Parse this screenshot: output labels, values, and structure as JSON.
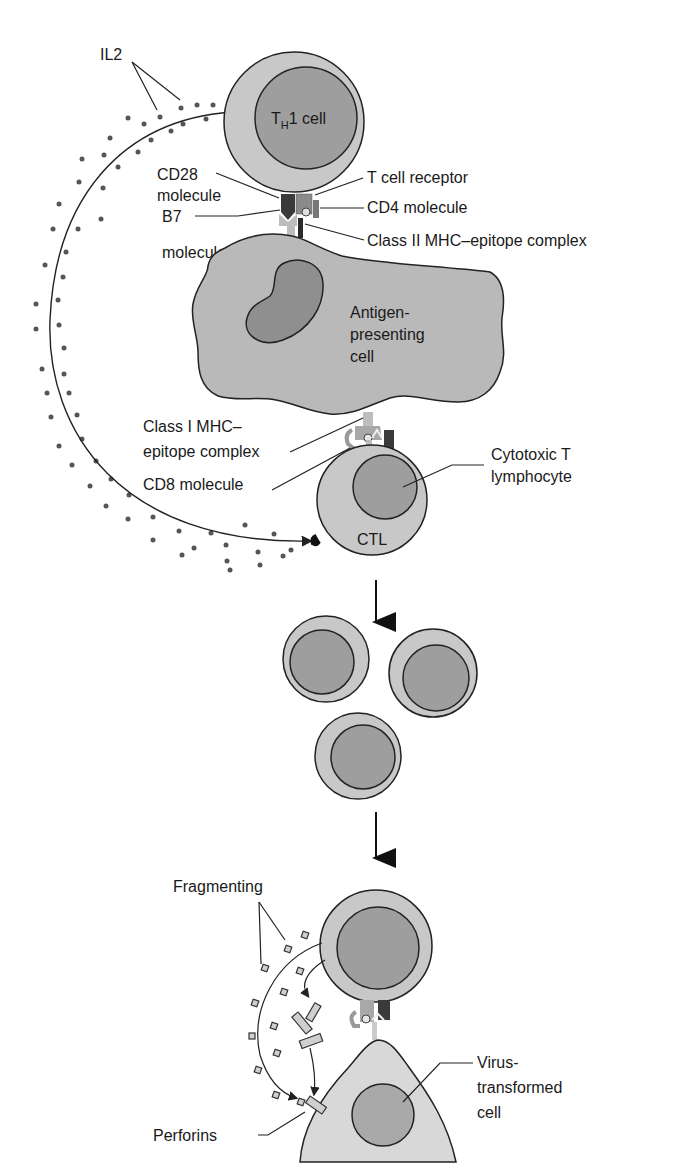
{
  "diagram": {
    "colors": {
      "cytoplasm": "#c8c8c8",
      "nucleus": "#9a9a9a",
      "apc_body": "#b9b9b9",
      "apc_nucleus": "#8f8f8f",
      "target_cell": "#d8d8d8",
      "target_nucleus": "#a9a9a9",
      "outline": "#222222",
      "dots": "#555555",
      "cd28": "#3a3a3a",
      "b7": "#bdbdbd",
      "tcr": "#8a8a8a"
    },
    "labels": {
      "il2": "IL2",
      "th1_cell_prefix": "T",
      "th1_cell_sub": "H",
      "th1_cell_suffix": "1 cell",
      "cd28_line1": "CD28",
      "cd28_line2": "molecule",
      "b7_line1": "B7",
      "b7_line2": "molecule",
      "tcr": "T cell receptor",
      "cd4": "CD4 molecule",
      "class2": "Class II MHC–epitope complex",
      "apc_line1": "Antigen-",
      "apc_line2": "presenting",
      "apc_line3": "cell",
      "class1_line1": "Class I MHC–",
      "class1_line2": "epitope complex",
      "cd8": "CD8 molecule",
      "ctl_desc_line1": "Cytotoxic T",
      "ctl_desc_line2": "lymphocyte",
      "ctl": "CTL",
      "fragmenting": "Fragmenting",
      "perforins": "Perforins",
      "virus_line1": "Virus-",
      "virus_line2": "transformed",
      "virus_line3": "cell"
    }
  }
}
